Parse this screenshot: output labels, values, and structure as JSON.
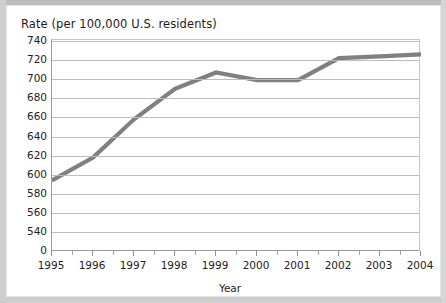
{
  "chart_data": {
    "type": "line",
    "title": "Rate (per 100,000 U.S. residents)",
    "xlabel": "Year",
    "ylabel": "",
    "grid": true,
    "legend": false,
    "legend_position": "none",
    "line_color": "#808080",
    "x": [
      1995,
      1996,
      1997,
      1998,
      1999,
      2000,
      2001,
      2002,
      2003,
      2004
    ],
    "categories": [
      "1995",
      "1996",
      "1997",
      "1998",
      "1999",
      "2000",
      "2001",
      "2002",
      "2003",
      "2004"
    ],
    "values": [
      594,
      618,
      658,
      690,
      707,
      699,
      699,
      722,
      724,
      726
    ],
    "series": [
      {
        "name": "Rate per 100,000 U.S. residents",
        "values": [
          594,
          618,
          658,
          690,
          707,
          699,
          699,
          722,
          724,
          726
        ]
      }
    ],
    "ylim": [
      540,
      740
    ],
    "ytick_labels": [
      "740",
      "720",
      "700",
      "680",
      "660",
      "640",
      "620",
      "600",
      "580",
      "560",
      "540",
      "0"
    ],
    "ytick_values": [
      740,
      720,
      700,
      680,
      660,
      640,
      620,
      600,
      580,
      560,
      540,
      0
    ],
    "xlim": [
      1995,
      2004
    ],
    "xtick_labels": [
      "1995",
      "1996",
      "1997",
      "1998",
      "1999",
      "2000",
      "2001",
      "2002",
      "2003",
      "2004"
    ],
    "axis_break": true,
    "axis_break_note": "y-axis broken between 0 and 540"
  },
  "colors": {
    "line": "#808080",
    "grid": "#bcbcbc",
    "axis": "#9a9a9a",
    "text": "#1c1c1c",
    "background": "#ffffff",
    "surround": "#c9c9c9"
  }
}
